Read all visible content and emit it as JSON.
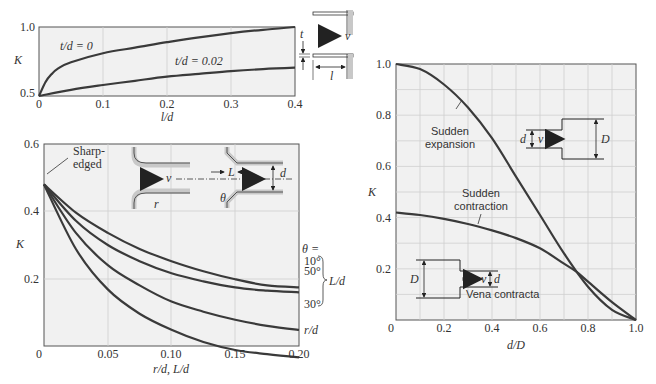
{
  "chart_data": [
    {
      "id": "chart1",
      "type": "line",
      "title": "",
      "xlabel": "l/d",
      "ylabel": "K",
      "xlim": [
        0,
        0.4
      ],
      "ylim": [
        0.5,
        1.0
      ],
      "xticks": [
        "0",
        "0.1",
        "0.2",
        "0.3",
        "0.4"
      ],
      "yticks": [
        "0.5",
        "1.0"
      ],
      "grid": true,
      "series": [
        {
          "name": "t/d = 0",
          "x": [
            0,
            0.01,
            0.02,
            0.03,
            0.05,
            0.1,
            0.15,
            0.2,
            0.25,
            0.3,
            0.35,
            0.4
          ],
          "values": [
            0.5,
            0.6,
            0.66,
            0.7,
            0.745,
            0.81,
            0.85,
            0.89,
            0.925,
            0.955,
            0.98,
            1.0
          ]
        },
        {
          "name": "t/d = 0.02",
          "x": [
            0,
            0.05,
            0.1,
            0.15,
            0.2,
            0.25,
            0.3,
            0.35,
            0.4
          ],
          "values": [
            0.5,
            0.545,
            0.58,
            0.61,
            0.64,
            0.66,
            0.68,
            0.695,
            0.705
          ]
        }
      ],
      "annotations": [
        "t/d = 0",
        "t/d = 0.02"
      ],
      "inset_labels": [
        "t",
        "v",
        "l"
      ]
    },
    {
      "id": "chart2",
      "type": "line",
      "title": "",
      "xlabel": "r/d, L/d",
      "ylabel": "K",
      "xlim": [
        0,
        0.2
      ],
      "ylim": [
        0.1,
        0.6
      ],
      "xticks": [
        "0",
        "0.05",
        "0.10",
        "0.15",
        "0.20"
      ],
      "yticks": [
        "0.2",
        "0.4",
        "0.6"
      ],
      "grid": true,
      "series": [
        {
          "name": "θ = 10°",
          "x": [
            0,
            0.025,
            0.05,
            0.075,
            0.1,
            0.125,
            0.15,
            0.175,
            0.2
          ],
          "values": [
            0.5,
            0.43,
            0.38,
            0.34,
            0.31,
            0.285,
            0.265,
            0.25,
            0.245
          ]
        },
        {
          "name": "θ = 50°",
          "x": [
            0,
            0.025,
            0.05,
            0.075,
            0.1,
            0.125,
            0.15,
            0.175,
            0.2
          ],
          "values": [
            0.5,
            0.41,
            0.35,
            0.31,
            0.28,
            0.26,
            0.245,
            0.237,
            0.233
          ]
        },
        {
          "name": "θ = 30°",
          "x": [
            0,
            0.025,
            0.05,
            0.075,
            0.1,
            0.125,
            0.15,
            0.175,
            0.2
          ],
          "values": [
            0.5,
            0.38,
            0.3,
            0.25,
            0.21,
            0.185,
            0.165,
            0.15,
            0.14
          ]
        },
        {
          "name": "r/d",
          "x": [
            0,
            0.025,
            0.05,
            0.075,
            0.1,
            0.125,
            0.15,
            0.175,
            0.2
          ],
          "values": [
            0.5,
            0.34,
            0.24,
            0.18,
            0.14,
            0.11,
            0.09,
            0.08,
            0.072
          ]
        }
      ],
      "annotations": [
        "Sharp-",
        "edged",
        "θ =",
        "10°",
        "50°",
        "30°",
        "L/d",
        "r/d"
      ],
      "inset_labels": [
        "v",
        "L",
        "d",
        "r",
        "θ"
      ]
    },
    {
      "id": "chart3",
      "type": "line",
      "title": "",
      "xlabel": "d/D",
      "ylabel": "K",
      "xlim": [
        0,
        1.0
      ],
      "ylim": [
        0,
        1.0
      ],
      "xticks": [
        "0",
        "0.2",
        "0.4",
        "0.6",
        "0.8",
        "1.0"
      ],
      "yticks": [
        "0.2",
        "0.4",
        "0.6",
        "0.8",
        "1.0"
      ],
      "grid": true,
      "series": [
        {
          "name": "Sudden expansion",
          "x": [
            0,
            0.1,
            0.2,
            0.3,
            0.4,
            0.5,
            0.6,
            0.7,
            0.8,
            0.9,
            1.0
          ],
          "values": [
            1.0,
            0.98,
            0.92,
            0.83,
            0.71,
            0.56,
            0.41,
            0.26,
            0.13,
            0.04,
            0.0
          ]
        },
        {
          "name": "Sudden contraction",
          "x": [
            0,
            0.1,
            0.2,
            0.3,
            0.4,
            0.5,
            0.6,
            0.7,
            0.75,
            0.8,
            0.9,
            1.0
          ],
          "values": [
            0.42,
            0.41,
            0.395,
            0.375,
            0.35,
            0.32,
            0.28,
            0.22,
            0.19,
            0.15,
            0.07,
            0.0
          ]
        }
      ],
      "annotations": [
        "Sudden",
        "expansion",
        "Sudden",
        "contraction",
        "Vena contracta"
      ],
      "inset_labels": [
        "d",
        "v",
        "D",
        "D",
        "v",
        "d"
      ]
    }
  ],
  "labels": {
    "c1": {
      "y_top": "1.0",
      "y_bot": "0.5",
      "x0": "0",
      "x1": "0.1",
      "x2": "0.2",
      "x3": "0.3",
      "x4": "0.4",
      "xlabel": "l/d",
      "ylabel": "K",
      "s1": "t/d = 0",
      "s2": "t/d = 0.02",
      "t": "t",
      "v": "v",
      "l": "l"
    },
    "c2": {
      "y6": "0.6",
      "y4": "0.4",
      "y2": "0.2",
      "x0": "0",
      "x1": "0.05",
      "x2": "0.10",
      "x3": "0.15",
      "x4": "0.20",
      "xlabel": "r/d, L/d",
      "ylabel": "K",
      "sharp1": "Sharp-",
      "sharp2": "edged",
      "theta": "θ =",
      "t10": "10°",
      "t50": "50°",
      "t30": "30°",
      "Ld": "L/d",
      "rd": "r/d",
      "v": "v",
      "L": "L",
      "d": "d",
      "r": "r",
      "th": "θ"
    },
    "c3": {
      "y10": "1.0",
      "y8": "0.8",
      "y6": "0.6",
      "y4": "0.4",
      "y2": "0.2",
      "x0": "0",
      "x2": "0.2",
      "x4": "0.4",
      "x6": "0.6",
      "x8": "0.8",
      "x10": "1.0",
      "xlabel": "d/D",
      "ylabel": "K",
      "exp1": "Sudden",
      "exp2": "expansion",
      "con1": "Sudden",
      "con2": "contraction",
      "vena": "Vena contracta",
      "d1": "d",
      "v1": "v",
      "D1": "D",
      "D2": "D",
      "v2": "v",
      "d2": "d"
    }
  }
}
